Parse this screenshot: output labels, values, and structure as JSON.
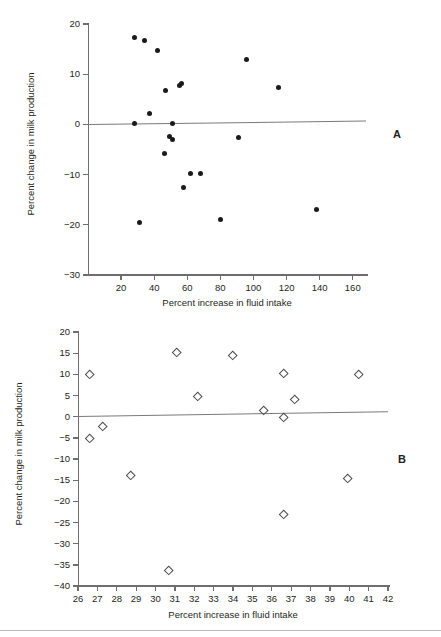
{
  "figure": {
    "panels": [
      {
        "letter": "A",
        "xlabel": "Percent increase in fluid intake",
        "ylabel": "Percent change in milk production"
      },
      {
        "letter": "B",
        "xlabel": "Percent increase in fluid intake",
        "ylabel": "Percent change in milk production"
      }
    ]
  },
  "chart_data": [
    {
      "type": "scatter",
      "panel": "A",
      "title": "",
      "xlabel": "Percent increase in fluid intake",
      "ylabel": "Percent change in milk production",
      "xlim": [
        0,
        168
      ],
      "ylim": [
        -30,
        20
      ],
      "xticks": [
        20,
        40,
        60,
        80,
        100,
        120,
        140,
        160
      ],
      "yticks": [
        -30,
        -20,
        -10,
        0,
        10,
        20
      ],
      "xticklabels": [
        "20",
        "40",
        "60",
        "80",
        "100",
        "120",
        "140",
        "160"
      ],
      "yticklabels": [
        "-30",
        "-20",
        "-10",
        "0",
        "10",
        "20"
      ],
      "grid": false,
      "legend": null,
      "marker": "filled-circle",
      "points": [
        {
          "x": 28,
          "y": 17.4
        },
        {
          "x": 34,
          "y": 16.7
        },
        {
          "x": 42,
          "y": 14.7
        },
        {
          "x": 96,
          "y": 13.0
        },
        {
          "x": 55,
          "y": 7.7
        },
        {
          "x": 56.5,
          "y": 8.2
        },
        {
          "x": 115,
          "y": 7.4
        },
        {
          "x": 47,
          "y": 6.8
        },
        {
          "x": 37,
          "y": 2.2
        },
        {
          "x": 28,
          "y": 0.2
        },
        {
          "x": 51,
          "y": 0.2
        },
        {
          "x": 49,
          "y": -2.4
        },
        {
          "x": 51,
          "y": -3.0
        },
        {
          "x": 91,
          "y": -2.7
        },
        {
          "x": 46,
          "y": -5.8
        },
        {
          "x": 62,
          "y": -9.7
        },
        {
          "x": 68,
          "y": -9.8
        },
        {
          "x": 58,
          "y": -12.6
        },
        {
          "x": 138,
          "y": -16.9
        },
        {
          "x": 80,
          "y": -19.0
        },
        {
          "x": 31,
          "y": -19.6
        }
      ],
      "trendline": {
        "x1": 0,
        "y1": 0.05,
        "x2": 168,
        "y2": 0.75
      }
    },
    {
      "type": "scatter",
      "panel": "B",
      "title": "",
      "xlabel": "Percent increase in fluid intake",
      "ylabel": "Percent change in milk production",
      "xlim": [
        26,
        42
      ],
      "ylim": [
        -40,
        20
      ],
      "xticks": [
        26,
        27,
        28,
        29,
        30,
        31,
        32,
        33,
        34,
        35,
        36,
        37,
        38,
        39,
        40,
        41,
        42
      ],
      "yticks": [
        -40,
        -35,
        -30,
        -25,
        -20,
        -15,
        -10,
        -5,
        0,
        5,
        10,
        15,
        20
      ],
      "xticklabels": [
        "26",
        "27",
        "28",
        "29",
        "30",
        "31",
        "32",
        "33",
        "34",
        "35",
        "36",
        "37",
        "38",
        "39",
        "40",
        "41",
        "42"
      ],
      "yticklabels": [
        "-40",
        "-35",
        "-30",
        "-25",
        "-20",
        "-15",
        "-10",
        "-5",
        "0",
        "5",
        "10",
        "15",
        "20"
      ],
      "grid": false,
      "legend": null,
      "marker": "open-diamond",
      "points": [
        {
          "x": 26.6,
          "y": 10.0
        },
        {
          "x": 31.1,
          "y": 15.0
        },
        {
          "x": 34.0,
          "y": 14.4
        },
        {
          "x": 36.6,
          "y": 10.2
        },
        {
          "x": 40.5,
          "y": 10.0
        },
        {
          "x": 32.2,
          "y": 4.6
        },
        {
          "x": 37.2,
          "y": 3.9
        },
        {
          "x": 35.6,
          "y": 1.3
        },
        {
          "x": 36.6,
          "y": -0.2
        },
        {
          "x": 27.3,
          "y": -2.3
        },
        {
          "x": 26.6,
          "y": -5.2
        },
        {
          "x": 28.7,
          "y": -14.0
        },
        {
          "x": 39.9,
          "y": -14.6
        },
        {
          "x": 36.6,
          "y": -23.1
        },
        {
          "x": 30.7,
          "y": -36.3
        }
      ],
      "trendline": {
        "x1": 26,
        "y1": 0.1,
        "x2": 42,
        "y2": 1.2
      }
    }
  ]
}
